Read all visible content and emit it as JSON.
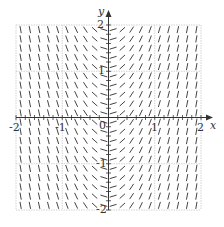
{
  "diagram": {
    "type": "slope_field",
    "title": "",
    "x_axis": {
      "label": "x",
      "min": -2,
      "max": 2,
      "ticks": [
        "-2",
        "-1",
        "0",
        "1",
        "2"
      ]
    },
    "y_axis": {
      "label": "y",
      "min": -2,
      "max": 2,
      "ticks": [
        "-2",
        "-1",
        "1",
        "2"
      ]
    },
    "origin_label": "0",
    "grid": {
      "step": 1,
      "color": "#c8c8c8"
    },
    "segments": {
      "cols": 20,
      "rows": 20,
      "slope_depends_on": "x",
      "color": "#444444"
    },
    "colors": {
      "axis": "#333333",
      "segment": "#444444",
      "grid": "#c8c8c8"
    }
  },
  "labels": {
    "x_axis_name": "x",
    "y_axis_name": "y",
    "x_neg2": "-2",
    "x_neg1": "-1",
    "x_pos1": "1",
    "x_pos2": "2",
    "origin": "0",
    "y_pos2": "2",
    "y_pos1": "1",
    "y_neg1": "-1",
    "y_neg2": "-2"
  }
}
